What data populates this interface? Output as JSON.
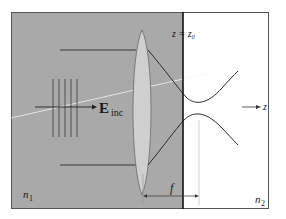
{
  "figure": {
    "labels": {
      "interface_plane": "z = z₀",
      "field": "E",
      "field_subscript": "inc",
      "axis": "z",
      "focal_length": "f",
      "medium1": "n",
      "medium1_subscript": "1",
      "medium2": "n",
      "medium2_subscript": "2"
    },
    "colors": {
      "medium1_fill": "#a9a9a9",
      "medium2_fill": "#ffffff",
      "lens_fill": "#cfcfcf",
      "line": "#2a2a2a",
      "ray_white": "#f2f2f2"
    }
  }
}
